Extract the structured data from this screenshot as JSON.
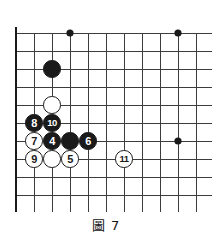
{
  "figure": {
    "caption_label": "圖",
    "caption_number": "7",
    "caption_full": "圖 7"
  },
  "board": {
    "type": "go-board",
    "grid_cols": 11,
    "grid_rows": 10,
    "cell_size": 18,
    "origin_x": 16,
    "origin_y": 33,
    "line_color": "#3c3c3c",
    "edge_color": "#1a1a1a",
    "background_color": "#ffffff",
    "left_edge_is_board_border": true,
    "bottom_edge_is_board_border": true,
    "star_points": [
      {
        "col": 3,
        "row": 0
      },
      {
        "col": 9,
        "row": 0
      },
      {
        "col": 9,
        "row": 6
      }
    ]
  },
  "stones": [
    {
      "id": "stone-black-plain-1",
      "color": "black",
      "label": "",
      "col": 2,
      "row": 2
    },
    {
      "id": "stone-white-plain-1",
      "color": "white",
      "label": "",
      "col": 2,
      "row": 4
    },
    {
      "id": "stone-8",
      "color": "black",
      "label": "8",
      "col": 1,
      "row": 5
    },
    {
      "id": "stone-10",
      "color": "black",
      "label": "10",
      "col": 2,
      "row": 5
    },
    {
      "id": "stone-7",
      "color": "white",
      "label": "7",
      "col": 1,
      "row": 6
    },
    {
      "id": "stone-4",
      "color": "black",
      "label": "4",
      "col": 2,
      "row": 6
    },
    {
      "id": "stone-black-plain-2",
      "color": "black",
      "label": "",
      "col": 3,
      "row": 6
    },
    {
      "id": "stone-6",
      "color": "black",
      "label": "6",
      "col": 4,
      "row": 6
    },
    {
      "id": "stone-9",
      "color": "white",
      "label": "9",
      "col": 1,
      "row": 7
    },
    {
      "id": "stone-white-plain-2",
      "color": "white",
      "label": "",
      "col": 2,
      "row": 7
    },
    {
      "id": "stone-5",
      "color": "white",
      "label": "5",
      "col": 3,
      "row": 7
    },
    {
      "id": "stone-11",
      "color": "white",
      "label": "11",
      "col": 6,
      "row": 7
    }
  ]
}
